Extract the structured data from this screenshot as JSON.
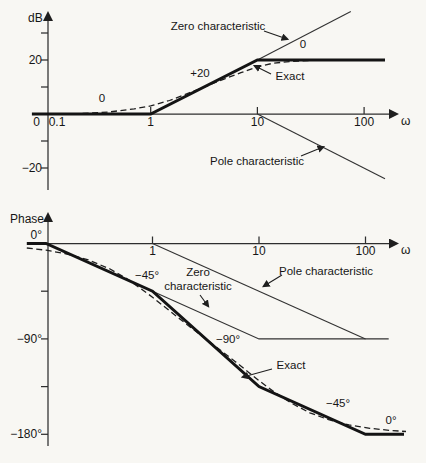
{
  "figure": {
    "width": 426,
    "height": 463,
    "background": "#f8f7f3",
    "ink": "#161616"
  },
  "chart_data": [
    {
      "type": "line",
      "id": "magnitude-plot",
      "title": "Bode magnitude plot of a zero at 1 and a pole at 10",
      "ylabel": "dB",
      "xlabel": "ω",
      "xscale": "log",
      "x_range": [
        0.1,
        250
      ],
      "y_range": [
        -30,
        40
      ],
      "grid": false,
      "legend": "none",
      "layout": {
        "x0_px": 44,
        "px_per_decade": 106.7,
        "x_ref": 0.1,
        "y0_px": 114,
        "px_per_unit": 2.7,
        "axis_x_px": 48,
        "axis_top_px": 14,
        "axis_bottom_px": 190,
        "axis_right_px": 396,
        "tick_len": 7,
        "x_label_baseline": 126,
        "ylabel_pos": [
          28,
          22
        ],
        "xlabel_pos": [
          401,
          125
        ],
        "origin_label_pos": [
          40,
          126
        ]
      },
      "origin_label": "0",
      "x_ticks": [
        {
          "value": 0.1,
          "label": "0.1",
          "tick": false,
          "label_x": 57
        },
        {
          "value": 1,
          "label": "1",
          "tick": true
        },
        {
          "value": 10,
          "label": "10",
          "tick": true
        },
        {
          "value": 100,
          "label": "100",
          "tick": true
        }
      ],
      "y_ticks": [
        {
          "value": 30,
          "label": ""
        },
        {
          "value": 20,
          "label": "20"
        },
        {
          "value": 10,
          "label": ""
        },
        {
          "value": -10,
          "label": ""
        },
        {
          "value": -20,
          "label": "−20"
        }
      ],
      "series": [
        {
          "name": "asymptotic composite",
          "style": "bold",
          "points": [
            [
              0.077,
              0
            ],
            [
              1,
              0
            ],
            [
              10,
              20
            ],
            [
              157,
              20
            ]
          ]
        },
        {
          "name": "zero characteristic",
          "style": "thin",
          "points": [
            [
              10,
              20
            ],
            [
              75,
              38
            ]
          ]
        },
        {
          "name": "pole characteristic",
          "style": "thin",
          "points": [
            [
              10,
              0
            ],
            [
              157,
              -24
            ]
          ]
        },
        {
          "name": "exact",
          "style": "dashed",
          "points": [
            [
              0.23,
              0.2
            ],
            [
              0.4,
              0.7
            ],
            [
              0.7,
              1.9
            ],
            [
              1,
              3
            ],
            [
              1.5,
              5
            ],
            [
              2,
              6.9
            ],
            [
              3,
              9.6
            ],
            [
              5,
              13.1
            ],
            [
              7,
              15.3
            ],
            [
              10,
              17.4
            ],
            [
              14,
              18.8
            ],
            [
              20,
              19.4
            ],
            [
              30,
              19.8
            ],
            [
              45,
              20
            ],
            [
              70,
              20
            ]
          ]
        }
      ],
      "annotations": [
        {
          "text": "Zero characteristic",
          "x": 218,
          "y": 27,
          "arrow": [
            264,
            31,
            287,
            39
          ]
        },
        {
          "text": "0",
          "x": 102,
          "y": 99
        },
        {
          "text": "+20",
          "x": 200,
          "y": 74
        },
        {
          "text": "0",
          "x": 303,
          "y": 45
        },
        {
          "text": "Exact",
          "x": 290,
          "y": 77,
          "arrow": [
            271,
            74,
            255,
            66
          ]
        },
        {
          "text": "Pole characteristic",
          "x": 257,
          "y": 162,
          "arrow": [
            301,
            156,
            323,
            147
          ]
        }
      ]
    },
    {
      "type": "line",
      "id": "phase-plot",
      "title": "Bode phase plot with straight-line segments of slope −45°, −90°, −45°, 0° per decade",
      "ylabel": "Phase",
      "xlabel": "ω",
      "xscale": "log",
      "x_range": [
        0.1,
        250
      ],
      "y_range": [
        -185,
        5
      ],
      "grid": false,
      "legend": "none",
      "layout": {
        "x0_px": 46,
        "px_per_decade": 106.5,
        "x_ref": 0.1,
        "y0_px": 243.5,
        "px_per_unit": 1.06,
        "axis_x_px": 48,
        "axis_top_px": 215,
        "axis_bottom_px": 446,
        "axis_right_px": 396,
        "tick_len": 7,
        "x_label_baseline": 255,
        "ylabel_pos": [
          10,
          223
        ],
        "xlabel_pos": [
          401,
          254
        ],
        "origin_label_pos": null
      },
      "origin_label": "",
      "x_ticks": [
        {
          "value": 1,
          "label": "1",
          "tick": true
        },
        {
          "value": 10,
          "label": "10",
          "tick": true
        },
        {
          "value": 100,
          "label": "100",
          "tick": true
        }
      ],
      "y_ticks": [
        {
          "value": 0,
          "label": "0°",
          "dy": -9
        },
        {
          "value": -45,
          "label": ""
        },
        {
          "value": -90,
          "label": "−90°"
        },
        {
          "value": -135,
          "label": ""
        },
        {
          "value": -180,
          "label": "−180°"
        }
      ],
      "series": [
        {
          "name": "asymptotic composite",
          "style": "bold",
          "points": [
            [
              0.066,
              0
            ],
            [
              0.1,
              0
            ],
            [
              1,
              -45
            ],
            [
              10,
              -135
            ],
            [
              100,
              -180
            ],
            [
              230,
              -180
            ]
          ]
        },
        {
          "name": "zero characteristic",
          "style": "thin",
          "points": [
            [
              1,
              -45
            ],
            [
              10,
              -90
            ],
            [
              165,
              -90
            ]
          ]
        },
        {
          "name": "pole characteristic",
          "style": "thin",
          "points": [
            [
              1,
              0
            ],
            [
              100,
              -90
            ]
          ]
        },
        {
          "name": "exact",
          "style": "dashed",
          "points": [
            [
              0.066,
              -4.2
            ],
            [
              0.1,
              -6.3
            ],
            [
              0.15,
              -9.4
            ],
            [
              0.25,
              -15.5
            ],
            [
              0.4,
              -24.1
            ],
            [
              0.6,
              -34.4
            ],
            [
              1,
              -50.7
            ],
            [
              1.5,
              -64.8
            ],
            [
              2,
              -74.7
            ],
            [
              3,
              -88.3
            ],
            [
              4,
              -97.8
            ],
            [
              6,
              -111.5
            ],
            [
              8,
              -121.6
            ],
            [
              10,
              -129.3
            ],
            [
              14,
              -140.4
            ],
            [
              20,
              -150.5
            ],
            [
              30,
              -159.7
            ],
            [
              45,
              -166.2
            ],
            [
              70,
              -171.1
            ],
            [
              110,
              -174.3
            ],
            [
              170,
              -176.3
            ],
            [
              240,
              -177.4
            ]
          ]
        }
      ],
      "annotations": [
        {
          "text": "−45°",
          "x": 147,
          "y": 276
        },
        {
          "text": "Zero\ncharacteristic",
          "x": 198,
          "y": 273,
          "arrow": [
            200,
            295,
            208,
            306
          ]
        },
        {
          "text": "Pole characteristic",
          "x": 326,
          "y": 272,
          "arrow": [
            282,
            275,
            264,
            286
          ]
        },
        {
          "text": "−90°",
          "x": 228,
          "y": 340
        },
        {
          "text": "Exact",
          "x": 291,
          "y": 366,
          "arrow": [
            272,
            369,
            243,
            377
          ]
        },
        {
          "text": "−45°",
          "x": 338,
          "y": 404
        },
        {
          "text": "0°",
          "x": 391,
          "y": 421
        }
      ]
    }
  ]
}
